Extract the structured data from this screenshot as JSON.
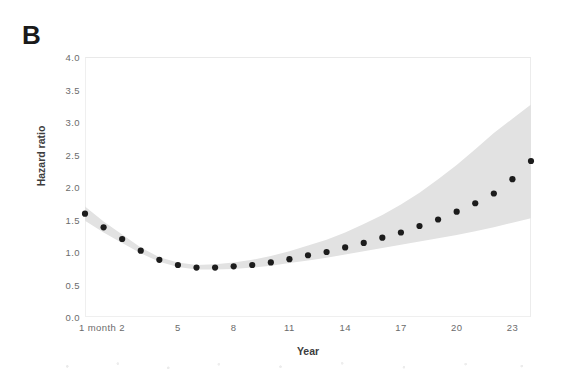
{
  "panel": {
    "label": "B"
  },
  "axes": {
    "y_title": "Hazard ratio",
    "x_title": "Year",
    "y_ticks": [
      "0.0",
      "0.5",
      "1.0",
      "1.5",
      "2.0",
      "2.5",
      "3.0",
      "3.5",
      "4.0"
    ],
    "x_ticks": [
      "1 month",
      "2",
      "5",
      "8",
      "11",
      "14",
      "17",
      "20",
      "23"
    ]
  },
  "style": {
    "point_color": "#1c1c1c",
    "band_color": "#e2e2e2",
    "frame_color": "#efefef",
    "tick_text_color": "#6b6b6b",
    "title_text_color": "#3d3d3d"
  },
  "chart_data": {
    "type": "scatter",
    "title": "B",
    "xlabel": "Year",
    "ylabel": "Hazard ratio",
    "xlim": [
      0,
      24
    ],
    "ylim": [
      0.0,
      4.0
    ],
    "grid": false,
    "legend": null,
    "x_tick_values": [
      0,
      2,
      5,
      8,
      11,
      14,
      17,
      20,
      23
    ],
    "x_tick_labels": [
      "1 month",
      "2",
      "5",
      "8",
      "11",
      "14",
      "17",
      "20",
      "23"
    ],
    "y_tick_values": [
      0.0,
      0.5,
      1.0,
      1.5,
      2.0,
      2.5,
      3.0,
      3.5,
      4.0
    ],
    "x": [
      0,
      1,
      2,
      3,
      4,
      5,
      6,
      7,
      8,
      9,
      10,
      11,
      12,
      13,
      14,
      15,
      16,
      17,
      18,
      19,
      20,
      21,
      22,
      23,
      24
    ],
    "series": [
      {
        "name": "Hazard ratio (point estimate)",
        "marker": "filled-circle",
        "values": [
          1.59,
          1.38,
          1.2,
          1.02,
          0.88,
          0.8,
          0.76,
          0.76,
          0.78,
          0.8,
          0.84,
          0.89,
          0.95,
          1.0,
          1.07,
          1.14,
          1.22,
          1.3,
          1.4,
          1.5,
          1.62,
          1.75,
          1.9,
          2.12,
          2.4
        ]
      },
      {
        "name": "95% confidence interval (lower)",
        "type": "band-lower",
        "values": [
          1.48,
          1.3,
          1.14,
          0.98,
          0.85,
          0.77,
          0.73,
          0.73,
          0.74,
          0.76,
          0.79,
          0.83,
          0.87,
          0.91,
          0.96,
          1.01,
          1.06,
          1.11,
          1.16,
          1.21,
          1.26,
          1.32,
          1.38,
          1.45,
          1.52
        ]
      },
      {
        "name": "95% confidence interval (upper)",
        "type": "band-upper",
        "values": [
          1.7,
          1.47,
          1.27,
          1.07,
          0.92,
          0.84,
          0.8,
          0.81,
          0.84,
          0.88,
          0.94,
          1.01,
          1.1,
          1.19,
          1.3,
          1.43,
          1.57,
          1.73,
          1.91,
          2.12,
          2.34,
          2.58,
          2.83,
          3.05,
          3.27
        ]
      }
    ]
  }
}
